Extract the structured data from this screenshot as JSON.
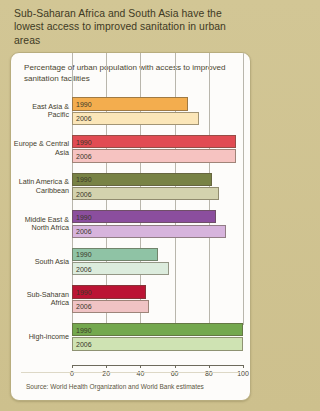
{
  "title": "Sub-Saharan Africa and South Asia have the lowest access to improved sanitation in urban areas",
  "source": "Source: World Health Organization and World Bank estimates",
  "series_labels": {
    "y1990": "1990",
    "y2006": "2006"
  },
  "chart_data": {
    "type": "bar",
    "orientation": "horizontal",
    "title": "Percentage of urban population with access to improved sanitation facilities",
    "xlabel": "",
    "ylabel": "",
    "xlim": [
      0,
      100
    ],
    "xticks": [
      0,
      20,
      40,
      60,
      80,
      100
    ],
    "grid": true,
    "legend": "inline-bar-labels",
    "categories": [
      "East Asia & Pacific",
      "Europe & Central Asia",
      "Latin America & Caribbean",
      "Middle East & North Africa",
      "South Asia",
      "Sub-Saharan Africa",
      "High-income"
    ],
    "series": [
      {
        "name": "1990",
        "values": [
          68,
          96,
          82,
          84,
          50,
          43,
          100
        ]
      },
      {
        "name": "2006",
        "values": [
          74,
          96,
          86,
          90,
          57,
          45,
          100
        ]
      }
    ],
    "category_colors": [
      {
        "category": "East Asia & Pacific",
        "y1990": "#f3ad4e",
        "y2006": "#fbe6b8"
      },
      {
        "category": "Europe & Central Asia",
        "y1990": "#e14b53",
        "y2006": "#f6c3c1"
      },
      {
        "category": "Latin America & Caribbean",
        "y1990": "#788245",
        "y2006": "#d3d2ae"
      },
      {
        "category": "Middle East & North Africa",
        "y1990": "#8b4e9e",
        "y2006": "#d7b4dd"
      },
      {
        "category": "South Asia",
        "y1990": "#8fc3a5",
        "y2006": "#dcecdd"
      },
      {
        "category": "Sub-Saharan Africa",
        "y1990": "#bb1434",
        "y2006": "#f0c3c4"
      },
      {
        "category": "High-income",
        "y1990": "#74a84e",
        "y2006": "#cfe3b3"
      }
    ]
  }
}
